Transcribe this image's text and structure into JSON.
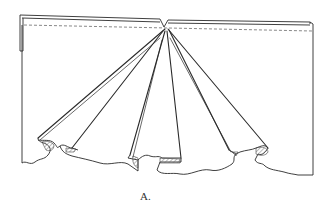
{
  "figure": {
    "caption": "A.",
    "colors": {
      "line": "#2a2a2a",
      "dash": "#555555",
      "hatch": "#777777",
      "background": "#ffffff"
    }
  }
}
